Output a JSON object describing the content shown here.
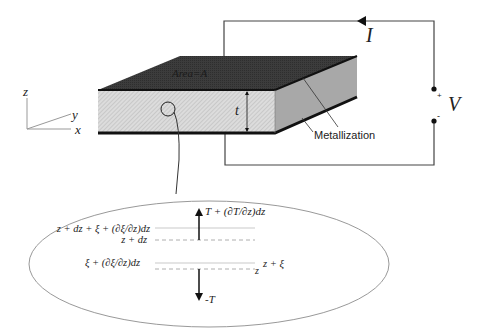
{
  "diagram": {
    "colors": {
      "top_face": "#3a3a3a",
      "front_face": "#d9d9d9",
      "side_face": "#a6a6a6",
      "metallization": "#111111",
      "wire": "#444444",
      "ellipse": "#888888",
      "guide_line": "#aaaaaa"
    },
    "axes": {
      "z_label": "z",
      "y_label": "y",
      "x_label": "x"
    },
    "slab": {
      "area_label": "Area=A",
      "thickness_label": "t",
      "metallization_label": "Metallization"
    },
    "circuit": {
      "current_label": "I",
      "voltage_label": "V",
      "plus_label": "+",
      "minus_label": "-"
    },
    "detail": {
      "top_force_label": "T + (∂T/∂z)dz",
      "bottom_force_label": "-T",
      "upper_displaced_label": "z + dz + ξ + (∂ξ/∂z)dz",
      "upper_position_label": "z + dz",
      "lower_displaced_label": "ξ + (∂ξ/∂z)dz",
      "lower_position_label": "z",
      "lower_position_displaced_label": "z + ξ"
    }
  }
}
